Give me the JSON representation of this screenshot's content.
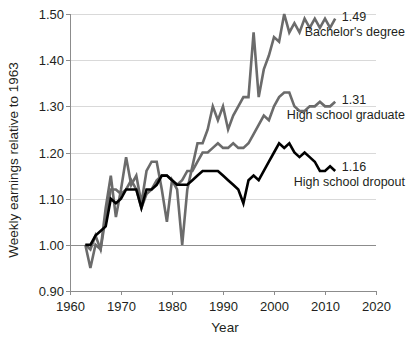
{
  "chart_data": {
    "type": "line",
    "title": "",
    "xlabel": "Year",
    "ylabel": "Weekly earnings relative to 1963",
    "xlim": [
      1960,
      2020
    ],
    "ylim": [
      0.9,
      1.5
    ],
    "xticks": [
      "1960",
      "1970",
      "1980",
      "1990",
      "2000",
      "2010",
      "2020"
    ],
    "xtick_values": [
      1960,
      1970,
      1980,
      1990,
      2000,
      2010,
      2020
    ],
    "yticks": [
      "0.90",
      "1.00",
      "1.10",
      "1.20",
      "1.30",
      "1.40",
      "1.50"
    ],
    "ytick_values": [
      0.9,
      1.0,
      1.1,
      1.2,
      1.3,
      1.4,
      1.5
    ],
    "grid": "horizontal",
    "legend_position": "inline-right-end-of-line",
    "x": [
      1963,
      1964,
      1965,
      1966,
      1967,
      1968,
      1969,
      1970,
      1971,
      1972,
      1973,
      1974,
      1975,
      1976,
      1977,
      1978,
      1979,
      1980,
      1981,
      1982,
      1983,
      1984,
      1985,
      1986,
      1987,
      1988,
      1989,
      1990,
      1991,
      1992,
      1993,
      1994,
      1995,
      1996,
      1997,
      1998,
      1999,
      2000,
      2001,
      2002,
      2003,
      2004,
      2005,
      2006,
      2007,
      2008,
      2009,
      2010,
      2011,
      2012
    ],
    "series": [
      {
        "name": "Bachelor's degree",
        "end_label": "1.49",
        "end_value": 1.49,
        "color": "#6b6b6b",
        "linewidth": 2.6,
        "values": [
          1.0,
          0.95,
          1.0,
          0.99,
          1.08,
          1.15,
          1.06,
          1.12,
          1.19,
          1.13,
          1.15,
          1.09,
          1.16,
          1.18,
          1.18,
          1.12,
          1.05,
          1.14,
          1.12,
          1.0,
          1.12,
          1.17,
          1.22,
          1.22,
          1.25,
          1.3,
          1.27,
          1.3,
          1.25,
          1.28,
          1.3,
          1.32,
          1.32,
          1.46,
          1.32,
          1.38,
          1.41,
          1.45,
          1.44,
          1.5,
          1.46,
          1.48,
          1.46,
          1.49,
          1.47,
          1.49,
          1.47,
          1.49,
          1.47,
          1.49
        ]
      },
      {
        "name": "High school graduate",
        "end_label": "1.31",
        "end_value": 1.31,
        "color": "#6b6b6b",
        "linewidth": 2.6,
        "values": [
          1.0,
          0.99,
          1.02,
          0.99,
          1.06,
          1.12,
          1.12,
          1.11,
          1.12,
          1.14,
          1.12,
          1.08,
          1.11,
          1.12,
          1.14,
          1.15,
          1.15,
          1.14,
          1.13,
          1.14,
          1.16,
          1.16,
          1.18,
          1.2,
          1.2,
          1.21,
          1.22,
          1.21,
          1.21,
          1.22,
          1.21,
          1.21,
          1.22,
          1.24,
          1.26,
          1.28,
          1.27,
          1.3,
          1.32,
          1.33,
          1.33,
          1.3,
          1.29,
          1.29,
          1.3,
          1.3,
          1.31,
          1.3,
          1.3,
          1.31
        ]
      },
      {
        "name": "High school dropout",
        "end_label": "1.16",
        "end_value": 1.16,
        "color": "#000000",
        "linewidth": 2.6,
        "values": [
          1.0,
          1.0,
          1.02,
          1.03,
          1.04,
          1.1,
          1.09,
          1.1,
          1.12,
          1.12,
          1.12,
          1.08,
          1.12,
          1.12,
          1.13,
          1.15,
          1.15,
          1.14,
          1.13,
          1.13,
          1.13,
          1.14,
          1.15,
          1.16,
          1.16,
          1.16,
          1.16,
          1.15,
          1.14,
          1.13,
          1.12,
          1.09,
          1.14,
          1.15,
          1.14,
          1.16,
          1.18,
          1.2,
          1.22,
          1.21,
          1.22,
          1.2,
          1.19,
          1.2,
          1.19,
          1.18,
          1.16,
          1.16,
          1.17,
          1.16
        ]
      }
    ]
  }
}
